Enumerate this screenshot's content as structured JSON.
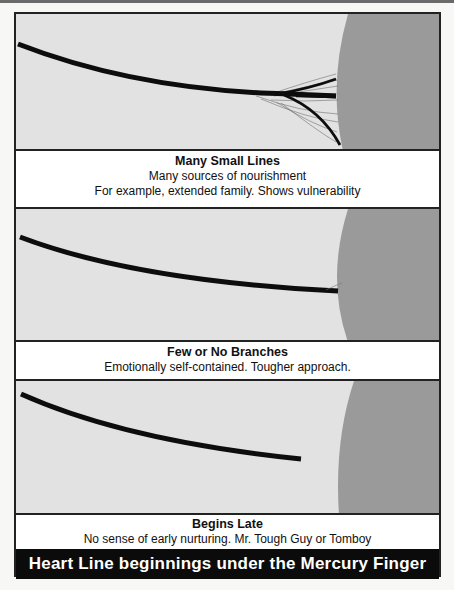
{
  "figure": {
    "title": "Heart Line beginnings under the Mercury Finger",
    "colors": {
      "panel_background": "#e2e2e2",
      "mount_gray": "#9a9a9a",
      "line": "#0d0d0d",
      "title_bar": "#0b0b0b",
      "title_text": "#ffffff"
    },
    "panels": [
      {
        "id": "many-small-lines",
        "heading": "Many Small Lines",
        "lines": [
          "Many sources of nourishment",
          "For example, extended family. Shows vulnerability"
        ],
        "illustration": "heart line ending in a fan of several thick and many thin branches at the edge of the palm"
      },
      {
        "id": "few-or-no-branches",
        "heading": "Few or No Branches",
        "lines": [
          "Emotionally self-contained. Tougher approach."
        ],
        "illustration": "single heart line reaching palm edge with no branches"
      },
      {
        "id": "begins-late",
        "heading": "Begins Late",
        "lines": [
          "No sense of early nurturing. Mr. Tough Guy or Tomboy"
        ],
        "illustration": "heart line stopping short of the palm edge"
      }
    ]
  }
}
